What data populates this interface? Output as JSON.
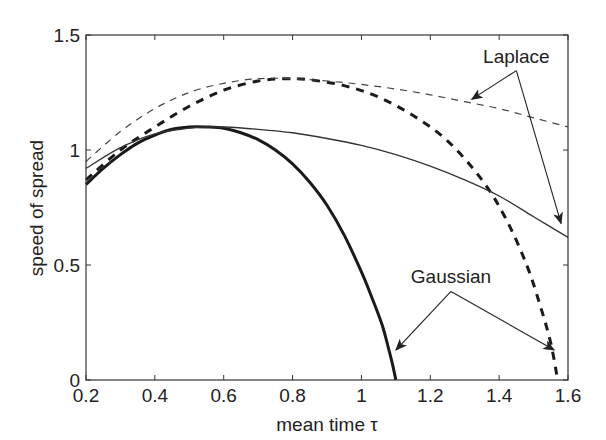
{
  "chart_data": {
    "type": "line",
    "title": "",
    "xlabel": "mean time τ",
    "ylabel": "speed of spread",
    "xlim": [
      0.2,
      1.6
    ],
    "ylim": [
      0,
      1.5
    ],
    "xticks": [
      0.2,
      0.4,
      0.6,
      0.8,
      1,
      1.2,
      1.4,
      1.6
    ],
    "xtick_labels": [
      "0.2",
      "0.4",
      "0.6",
      "0.8",
      "1",
      "1.2",
      "1.4",
      "1.6"
    ],
    "yticks": [
      0,
      0.5,
      1,
      1.5
    ],
    "ytick_labels": [
      "0",
      "0.5",
      "1",
      "1.5"
    ],
    "grid": false,
    "legend": "none (annotated with arrows)",
    "series": [
      {
        "name": "Gaussian (solid)",
        "style": "solid-thick",
        "x": [
          0.2,
          0.25,
          0.3,
          0.35,
          0.4,
          0.45,
          0.5,
          0.55,
          0.6,
          0.65,
          0.7,
          0.75,
          0.8,
          0.85,
          0.9,
          0.95,
          1.0,
          1.03,
          1.06,
          1.08,
          1.09,
          1.1
        ],
        "y": [
          0.85,
          0.92,
          0.98,
          1.03,
          1.065,
          1.09,
          1.1,
          1.1,
          1.095,
          1.075,
          1.045,
          1.0,
          0.94,
          0.86,
          0.76,
          0.63,
          0.47,
          0.36,
          0.24,
          0.13,
          0.07,
          0.0
        ]
      },
      {
        "name": "Gaussian (dashed)",
        "style": "dashed-thick",
        "x": [
          0.2,
          0.3,
          0.4,
          0.5,
          0.6,
          0.7,
          0.78,
          0.85,
          0.95,
          1.05,
          1.15,
          1.25,
          1.35,
          1.42,
          1.48,
          1.52,
          1.55,
          1.57
        ],
        "y": [
          0.87,
          1.0,
          1.1,
          1.19,
          1.26,
          1.3,
          1.31,
          1.305,
          1.28,
          1.23,
          1.15,
          1.04,
          0.87,
          0.7,
          0.5,
          0.32,
          0.16,
          0.0
        ]
      },
      {
        "name": "Laplace (solid)",
        "style": "solid-thin",
        "x": [
          0.2,
          0.3,
          0.4,
          0.5,
          0.55,
          0.6,
          0.7,
          0.8,
          0.9,
          1.0,
          1.1,
          1.2,
          1.3,
          1.4,
          1.5,
          1.6
        ],
        "y": [
          0.92,
          1.01,
          1.07,
          1.095,
          1.1,
          1.1,
          1.09,
          1.075,
          1.05,
          1.02,
          0.98,
          0.93,
          0.87,
          0.8,
          0.71,
          0.62
        ]
      },
      {
        "name": "Laplace (dashed)",
        "style": "dashed-thin",
        "x": [
          0.2,
          0.3,
          0.4,
          0.5,
          0.6,
          0.7,
          0.8,
          0.9,
          1.0,
          1.1,
          1.2,
          1.3,
          1.4,
          1.5,
          1.6
        ],
        "y": [
          0.95,
          1.08,
          1.18,
          1.25,
          1.29,
          1.31,
          1.31,
          1.3,
          1.285,
          1.265,
          1.24,
          1.21,
          1.18,
          1.14,
          1.1
        ]
      }
    ],
    "annotations": [
      {
        "text": "Laplace",
        "x": 1.45,
        "y": 1.38,
        "arrows_to": [
          [
            1.32,
            1.22
          ],
          [
            1.58,
            0.68
          ]
        ]
      },
      {
        "text": "Gaussian",
        "x": 1.26,
        "y": 0.42,
        "arrows_to": [
          [
            1.1,
            0.13
          ],
          [
            1.56,
            0.13
          ]
        ]
      }
    ]
  }
}
